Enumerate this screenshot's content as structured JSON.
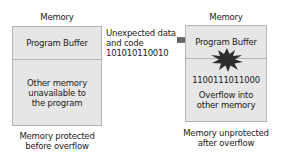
{
  "left_panel": {
    "title": "Memory",
    "buffer_label": "Program Buffer",
    "other_label": [
      "Other memory",
      "unavailable to",
      "the program"
    ],
    "caption": [
      "Memory protected",
      "before overflow"
    ]
  },
  "middle": {
    "input_label": [
      "Unexpected data",
      "and code",
      "101010110010"
    ],
    "arrow_icon": "right-arrow-icon"
  },
  "right_panel": {
    "title": "Memory",
    "buffer_label": "Program Buffer",
    "burst_icon": "explosion-burst-icon",
    "overflow_bits": "1100111011000",
    "overflow_label": [
      "Overflow into",
      "other memory"
    ],
    "caption": [
      "Memory unprotected",
      "after overflow"
    ]
  },
  "colors": {
    "box_fill": "#e6e6e6",
    "box_border": "#b5b5b5",
    "arrow": "#666666",
    "burst": "#2e2e2e"
  }
}
